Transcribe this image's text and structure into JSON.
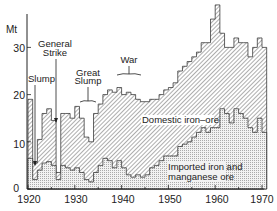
{
  "chart_data": {
    "type": "area",
    "title": "",
    "xlabel": "",
    "ylabel": "Mt",
    "xlim": [
      1920,
      1970
    ],
    "ylim": [
      0,
      35
    ],
    "x_ticks": [
      1920,
      1930,
      1940,
      1950,
      1960,
      1970
    ],
    "y_ticks": [
      0,
      10,
      20,
      30
    ],
    "grid": false,
    "stacked": true,
    "x": [
      1920,
      1921,
      1922,
      1923,
      1924,
      1925,
      1926,
      1927,
      1928,
      1929,
      1930,
      1931,
      1932,
      1933,
      1934,
      1935,
      1936,
      1937,
      1938,
      1939,
      1940,
      1941,
      1942,
      1943,
      1944,
      1945,
      1946,
      1947,
      1948,
      1949,
      1950,
      1951,
      1952,
      1953,
      1954,
      1955,
      1956,
      1957,
      1958,
      1959,
      1960,
      1961,
      1962,
      1963,
      1964,
      1965,
      1966,
      1967,
      1968,
      1969,
      1970
    ],
    "series": [
      {
        "name": "Imported iron and manganese ore",
        "pattern": "stipple",
        "values": [
          6.5,
          2,
          4,
          5.5,
          5.8,
          5,
          2,
          5,
          4.5,
          4,
          4.5,
          3.5,
          2,
          1.5,
          3.5,
          5,
          6.5,
          6,
          4.5,
          6,
          4.5,
          3,
          2.5,
          3,
          2.5,
          3,
          4.5,
          5,
          6,
          7,
          7,
          7,
          9,
          9.5,
          10,
          11,
          12,
          13,
          12,
          13,
          13,
          17,
          16,
          14,
          17,
          16,
          15,
          13,
          12,
          15,
          12
        ]
      },
      {
        "name": "Domestic iron-ore",
        "pattern": "hatched",
        "values": [
          12.5,
          3.5,
          6.5,
          10.5,
          11.2,
          9.5,
          1.5,
          11,
          11.5,
          11,
          13,
          11.5,
          9,
          8.5,
          12.5,
          13,
          13.5,
          15,
          16,
          15.5,
          15.5,
          17.5,
          17.5,
          16,
          16,
          15.5,
          14.5,
          14,
          14,
          14,
          14.5,
          15.5,
          16,
          16.5,
          17,
          17,
          17,
          18,
          19,
          23,
          26,
          16,
          14,
          16,
          15,
          15,
          16,
          15,
          18,
          17,
          18
        ]
      }
    ],
    "totals": [
      19,
      5.5,
      10.5,
      16,
      17,
      14.5,
      3.5,
      16,
      16,
      15,
      17.5,
      15,
      11,
      10,
      16,
      18,
      20,
      21,
      20.5,
      21.5,
      20,
      20.5,
      20,
      19,
      18.5,
      18.5,
      19,
      19,
      20,
      21,
      21.5,
      22.5,
      25,
      26,
      27,
      28,
      29,
      31,
      31,
      36,
      39,
      33,
      30,
      30,
      32,
      31,
      31,
      28,
      30,
      32,
      30
    ],
    "annotations": [
      {
        "text": "Slump",
        "x": 1921.5,
        "arrow": true
      },
      {
        "text": "General Strike",
        "x": 1926,
        "arrow": true
      },
      {
        "text": "Great Slump",
        "x": 1932,
        "bracket": [
          1930,
          1934
        ]
      },
      {
        "text": "War",
        "x": 1941.5,
        "bracket": [
          1939,
          1945
        ]
      }
    ],
    "series_labels": [
      {
        "text": "Domestic iron–ore",
        "series": "Domestic iron-ore"
      },
      {
        "text": "Imported iron and manganese ore",
        "series": "Imported iron and manganese ore"
      }
    ]
  },
  "labels": {
    "unit": "Mt",
    "y_ticks": [
      "0",
      "10",
      "20",
      "30"
    ],
    "x_ticks": [
      "1920",
      "1930",
      "1940",
      "1950",
      "1960",
      "1970"
    ],
    "slump": "Slump",
    "general_strike_1": "General",
    "general_strike_2": "Strike",
    "great_slump_1": "Great",
    "great_slump_2": "Slump",
    "war": "War",
    "domestic": "Domestic iron–ore",
    "imported_1": "Imported iron and",
    "imported_2": "manganese ore"
  }
}
